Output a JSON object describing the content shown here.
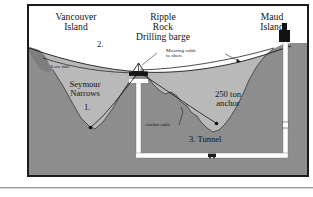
{
  "figure": {
    "kind": "cross-section-diagram",
    "colors": {
      "water": "#b9b9b9",
      "rock": "#8d8d8d",
      "rock_dark": "#7e7e7e",
      "sky": "#ffffff",
      "ink": "#141414",
      "tunnel": "#ffffff"
    }
  },
  "labels": {
    "vancouver_island": "Vancouver\nIsland",
    "ripple_rock": "Ripple\nRock\nDrilling barge",
    "maud_island": "Maud\nIsland",
    "mooring_cable": "Mooring cable\nto shore",
    "low_tide": "Low tide",
    "seymour_narrows": "Seymour\nNarrows",
    "marker_one": "1.",
    "marker_two": "2.",
    "marker_three": "3. Tunnel",
    "anchor_cable": "Anchor cable",
    "ton_anchor": "250 ton\nanchor"
  },
  "callouts": [
    {
      "id": "1",
      "text": "1.",
      "refers_to": "Seymour Narrows channel bottom"
    },
    {
      "id": "2",
      "text": "2.",
      "refers_to": "water surface / low tide line"
    },
    {
      "id": "3",
      "text": "3. Tunnel",
      "refers_to": "horizontal tunnel beneath the narrows"
    }
  ],
  "elements": {
    "barge_name": "Drilling barge",
    "shaft_name": "vertical shaft",
    "headframe_name": "headframe",
    "ore_cart_name": "ore cart",
    "anchor_weight": "250 ton"
  }
}
